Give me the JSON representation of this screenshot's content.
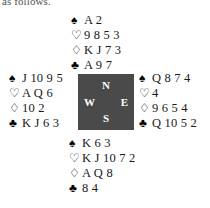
{
  "document": {
    "intro_text": "as follows.",
    "type": "bridge-hand-diagram"
  },
  "suits": {
    "spade": "♠",
    "heart": "♡",
    "diamond": "♢",
    "club": "♣"
  },
  "compass": {
    "north": "N",
    "west": "W",
    "east": "E",
    "south": "S",
    "background_color": "#4a4a4a",
    "text_color": "#ffffff"
  },
  "hands": {
    "north": {
      "label": "North",
      "spades": "A 2",
      "hearts": "9 8 5 3",
      "diamonds": "K J 7 3",
      "clubs": "A 9 7"
    },
    "west": {
      "label": "West",
      "spades": "J 10 9 5",
      "hearts": "A Q 6",
      "diamonds": "10 2",
      "clubs": "K J 6 3"
    },
    "east": {
      "label": "East",
      "spades": "Q 8 7 4",
      "hearts": "4",
      "diamonds": "9 6 5 4",
      "clubs": "Q 10 5 2"
    },
    "south": {
      "label": "South",
      "spades": "K 6 3",
      "hearts": "K J 10 7 2",
      "diamonds": "A Q 8",
      "clubs": "8 4"
    }
  }
}
